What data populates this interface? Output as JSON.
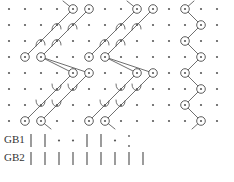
{
  "figure": {
    "type": "lattice-trellis-diagram",
    "background_color": "#ffffff",
    "ink_color": "#4a4a4a",
    "node_fill": "#ffffff",
    "dot_color": "#5a5a5a",
    "width": 234,
    "height": 182
  },
  "grid": {
    "description": "background dot lattice",
    "origin_x": 9,
    "origin_y": 9,
    "step_x": 16,
    "step_y": 16,
    "cols": 14,
    "rows": 8,
    "dot_radius": 1.1
  },
  "nodes": {
    "radius": 4.3,
    "center_dot_radius": 1.1,
    "description": "circled lattice sites marking active states",
    "points": [
      {
        "id": "n1",
        "col": 4,
        "row": 0
      },
      {
        "id": "n2",
        "col": 5,
        "row": 0
      },
      {
        "id": "n3",
        "col": 8,
        "row": 0
      },
      {
        "id": "n4",
        "col": 9,
        "row": 0
      },
      {
        "id": "n5",
        "col": 11,
        "row": 0
      },
      {
        "id": "n6",
        "col": 12,
        "row": 1
      },
      {
        "id": "n7",
        "col": 1,
        "row": 3
      },
      {
        "id": "n8",
        "col": 2,
        "row": 3
      },
      {
        "id": "n9",
        "col": 5,
        "row": 3
      },
      {
        "id": "n10",
        "col": 6,
        "row": 3
      },
      {
        "id": "n11",
        "col": 11,
        "row": 2
      },
      {
        "id": "n12",
        "col": 12,
        "row": 3
      },
      {
        "id": "n13",
        "col": 4,
        "row": 4
      },
      {
        "id": "n14",
        "col": 5,
        "row": 4
      },
      {
        "id": "n15",
        "col": 8,
        "row": 4
      },
      {
        "id": "n16",
        "col": 9,
        "row": 4
      },
      {
        "id": "n17",
        "col": 11,
        "row": 4
      },
      {
        "id": "n18",
        "col": 12,
        "row": 5
      },
      {
        "id": "n19",
        "col": 1,
        "row": 7
      },
      {
        "id": "n20",
        "col": 2,
        "row": 7
      },
      {
        "id": "n21",
        "col": 5,
        "row": 7
      },
      {
        "id": "n22",
        "col": 6,
        "row": 7
      },
      {
        "id": "n23",
        "col": 11,
        "row": 6
      },
      {
        "id": "n24",
        "col": 12,
        "row": 7
      }
    ]
  },
  "links": {
    "stroke_width": 0.8,
    "hook_description": "short curved hook stubs attached to intermediate lattice sites",
    "staircases": [
      {
        "id": "upper-left-block",
        "strands": [
          {
            "from_col": 1,
            "from_row": 3,
            "to_col": 4,
            "to_row": 0
          },
          {
            "from_col": 2,
            "from_row": 3,
            "to_col": 5,
            "to_row": 0
          }
        ],
        "hook_cols": [
          2,
          3
        ],
        "hook_rows": [
          2,
          1
        ]
      },
      {
        "id": "upper-mid-block",
        "strands": [
          {
            "from_col": 5,
            "from_row": 3,
            "to_col": 8,
            "to_row": 0
          },
          {
            "from_col": 6,
            "from_row": 3,
            "to_col": 9,
            "to_row": 0
          }
        ],
        "hook_cols": [
          6,
          7
        ],
        "hook_rows": [
          2,
          1
        ]
      },
      {
        "id": "lower-left-block",
        "strands": [
          {
            "from_col": 1,
            "from_row": 7,
            "to_col": 4,
            "to_row": 4
          },
          {
            "from_col": 2,
            "from_row": 7,
            "to_col": 5,
            "to_row": 4
          }
        ],
        "hook_cols": [
          2,
          3
        ],
        "hook_rows": [
          6,
          5
        ]
      },
      {
        "id": "lower-mid-block",
        "strands": [
          {
            "from_col": 5,
            "from_row": 7,
            "to_col": 8,
            "to_row": 4
          },
          {
            "from_col": 6,
            "from_row": 7,
            "to_col": 9,
            "to_row": 4
          }
        ],
        "hook_cols": [
          6,
          7
        ],
        "hook_rows": [
          6,
          5
        ]
      }
    ],
    "long_diagonals": [
      {
        "from_col": 2,
        "from_row": 3,
        "to_col": 4,
        "to_row": 4
      },
      {
        "from_col": 2,
        "from_row": 3,
        "to_col": 5,
        "to_row": 4
      },
      {
        "from_col": 6,
        "from_row": 3,
        "to_col": 8,
        "to_row": 4
      },
      {
        "from_col": 6,
        "from_row": 3,
        "to_col": 9,
        "to_row": 4
      }
    ],
    "stub_tails": [
      {
        "col": 4,
        "row": 0,
        "dx": -10,
        "dy": -8
      },
      {
        "col": 8,
        "row": 0,
        "dx": -10,
        "dy": -8
      },
      {
        "col": 2,
        "row": 7,
        "dx": 10,
        "dy": 8
      },
      {
        "col": 6,
        "row": 7,
        "dx": 10,
        "dy": 8
      }
    ],
    "zigzag": {
      "id": "right-column-zigzag",
      "description": "alternating V chain on the right side of the lattice",
      "path": [
        {
          "col": 11,
          "row": 0
        },
        {
          "col": 12,
          "row": 1
        },
        {
          "col": 11,
          "row": 2
        },
        {
          "col": 12,
          "row": 3
        },
        {
          "col": 11,
          "row": 4
        },
        {
          "col": 12,
          "row": 5
        },
        {
          "col": 11,
          "row": 6
        },
        {
          "col": 12,
          "row": 7
        }
      ],
      "head_stub": {
        "col": 11,
        "row": 0,
        "dx": 9,
        "dy": -8
      },
      "tail_stub": {
        "col": 12,
        "row": 7,
        "dx": -9,
        "dy": 8
      }
    }
  },
  "axis": {
    "rows": [
      {
        "label": "GB1",
        "label_x": 4,
        "label_y": 143,
        "tick_y_top": 134,
        "tick_y_bottom": 147,
        "marks": [
          "tick",
          "tick",
          "dot",
          "dot",
          "tick",
          "tick",
          "dot",
          "dot-small",
          "none"
        ]
      },
      {
        "label": "GB2",
        "label_x": 4,
        "label_y": 161,
        "tick_y_top": 152,
        "tick_y_bottom": 165,
        "marks": [
          "tick",
          "tick",
          "tick",
          "tick",
          "tick",
          "tick",
          "tick",
          "tick",
          "tick"
        ]
      }
    ],
    "tick_origin_x": 31,
    "tick_step_x": 14,
    "tick_count": 9,
    "tick_stroke_width": 1.1
  }
}
